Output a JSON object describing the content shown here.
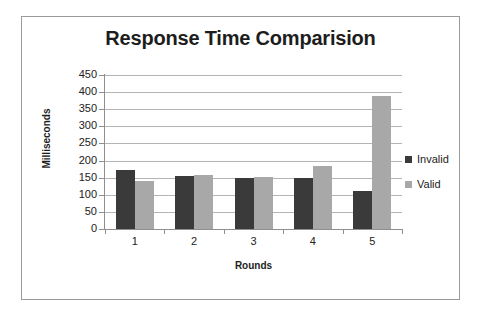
{
  "chart_data": {
    "type": "bar",
    "title": "Response Time Comparision",
    "xlabel": "Rounds",
    "ylabel": "Milliseconds",
    "categories": [
      "1",
      "2",
      "3",
      "4",
      "5"
    ],
    "series": [
      {
        "name": "Invalid",
        "color": "#3a3a3a",
        "values": [
          172,
          156,
          150,
          150,
          110
        ]
      },
      {
        "name": "Valid",
        "color": "#a8a8a8",
        "values": [
          140,
          158,
          151,
          185,
          390
        ]
      }
    ],
    "ylim": [
      0,
      450
    ],
    "ytick_step": 50,
    "yticks": [
      450,
      400,
      350,
      300,
      250,
      200,
      150,
      100,
      50,
      0
    ],
    "grid": true,
    "legend_position": "right",
    "frame_border_color": "#9a9a9a",
    "gridline_color": "#b4b4b4",
    "background": "#ffffff"
  }
}
